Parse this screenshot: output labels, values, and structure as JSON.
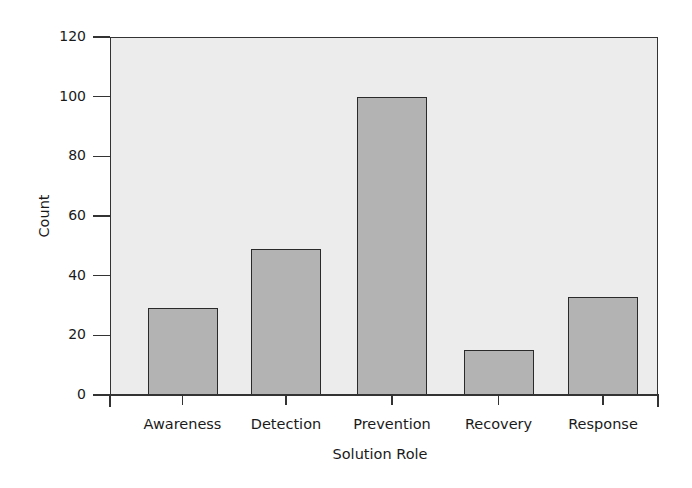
{
  "chart_data": {
    "type": "bar",
    "title": "",
    "xlabel": "Solution Role",
    "ylabel": "Count",
    "categories": [
      "Awareness",
      "Detection",
      "Prevention",
      "Recovery",
      "Response"
    ],
    "values": [
      29,
      49,
      100,
      15,
      33
    ],
    "ylim": [
      0,
      120
    ],
    "yticks": [
      0,
      20,
      40,
      60,
      80,
      100,
      120
    ],
    "ytick_labels": [
      "0",
      "20",
      "40",
      "60",
      "80",
      "100",
      "120"
    ],
    "grid": false,
    "legend": null,
    "colors": {
      "bar_fill": "#b3b3b3",
      "bar_edge": "#2a2a2a",
      "plot_background": "#ececec"
    }
  }
}
